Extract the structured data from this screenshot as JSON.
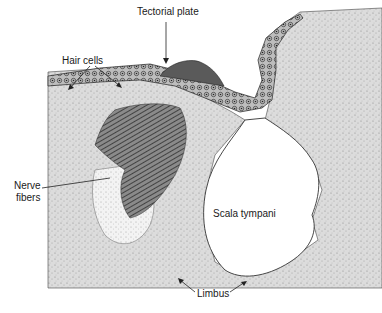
{
  "figure": {
    "type": "histology illustration",
    "labels": {
      "tectorial_plate": "Tectorial plate",
      "hair_cells": "Hair cells",
      "nerve_fibers_line1": "Nerve",
      "nerve_fibers_line2": "fibers",
      "scala_tympani": "Scala tympani",
      "limbus": "Limbus"
    }
  }
}
